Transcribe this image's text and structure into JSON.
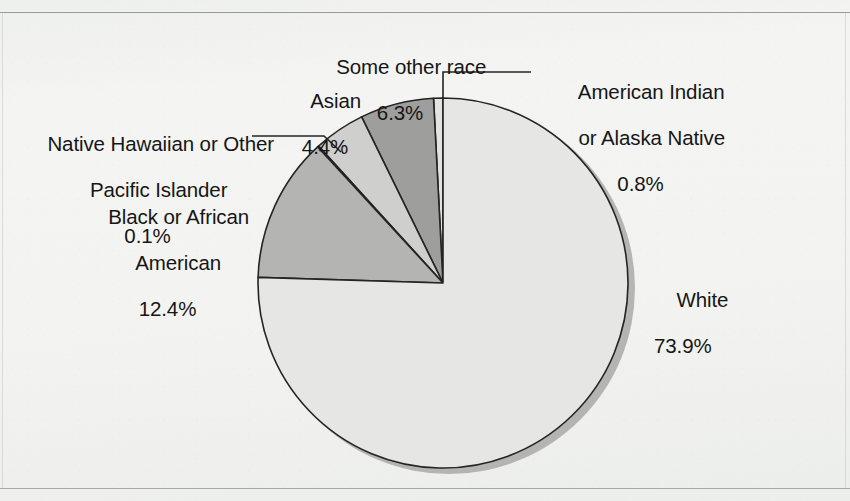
{
  "chart_data": {
    "type": "pie",
    "title": "",
    "subtitle": "",
    "xlabel": "",
    "ylabel": "",
    "legend_position": "callout-labels",
    "grid": false,
    "value_unit": "percent",
    "start_angle_deg": 90,
    "direction": "counterclockwise",
    "categories": [
      "American Indian or Alaska Native",
      "Some other race",
      "Asian",
      "Native Hawaiian or Other Pacific Islander",
      "Black or African American",
      "White"
    ],
    "values": [
      0.8,
      6.3,
      4.4,
      0.1,
      12.4,
      73.9
    ],
    "labels": [
      "0.8%",
      "6.3%",
      "4.4%",
      "0.1%",
      "12.4%",
      "73.9%"
    ],
    "colors": [
      "#e3e3e1",
      "#9e9e9c",
      "#cfcfcd",
      "#5e5e5c",
      "#b4b4b2",
      "#e6e6e4"
    ],
    "slices": [
      {
        "name": "American Indian or Alaska Native",
        "value": 0.8,
        "label": "0.8%",
        "color": "#e3e3e1"
      },
      {
        "name": "Some other race",
        "value": 6.3,
        "label": "6.3%",
        "color": "#9e9e9c"
      },
      {
        "name": "Asian",
        "value": 4.4,
        "label": "4.4%",
        "color": "#cfcfcd"
      },
      {
        "name": "Native Hawaiian or Other Pacific Islander",
        "value": 0.1,
        "label": "0.1%",
        "color": "#5e5e5c"
      },
      {
        "name": "Black or African American",
        "value": 12.4,
        "label": "12.4%",
        "color": "#b4b4b2"
      },
      {
        "name": "White",
        "value": 73.9,
        "label": "73.9%",
        "color": "#e6e6e4"
      }
    ]
  },
  "labels": {
    "some_other_race": {
      "line1": "Some other race",
      "pct": "6.3%"
    },
    "asian": {
      "line1": "Asian",
      "pct": "4.4%"
    },
    "american_indian": {
      "line1": "American Indian",
      "line2": "or Alaska Native",
      "pct": "0.8%"
    },
    "native_hawaiian": {
      "line1": "Native Hawaiian or Other",
      "line2": "Pacific Islander",
      "pct": "0.1%"
    },
    "black": {
      "line1": "Black or African",
      "line2": "American",
      "pct": "12.4%"
    },
    "white": {
      "line1": "White",
      "pct": "73.9%"
    }
  },
  "style": {
    "page_background": "#f2f2f0",
    "rule_color": "#9a9a9a",
    "outline_color": "#242424",
    "shadow_color": "#a5a5a3",
    "text_color": "#161616"
  }
}
